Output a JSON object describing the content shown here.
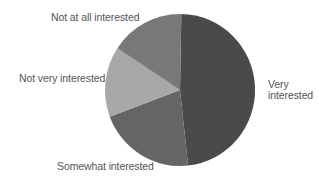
{
  "chart_data": {
    "type": "pie",
    "title": "",
    "start_angle_deg": 1,
    "direction": "clockwise",
    "center": [
      180,
      90
    ],
    "radius": [
      75,
      76
    ],
    "categories": [
      "Very interested",
      "Somewhat interested",
      "Not very interested",
      "Not at all interested"
    ],
    "values": [
      48,
      21,
      15,
      16
    ],
    "unit": "%",
    "colors": [
      "#4a4a4a",
      "#656565",
      "#a8a8a8",
      "#787878"
    ],
    "legend": "none (direct labels)",
    "labels": {
      "very": [
        "Very",
        "interested"
      ],
      "somewhat": "Somewhat interested",
      "not_very": "Not very interested",
      "not_at_all": "Not at all interested"
    }
  },
  "style": {
    "label_color": "#555555",
    "background": "#ffffff"
  }
}
